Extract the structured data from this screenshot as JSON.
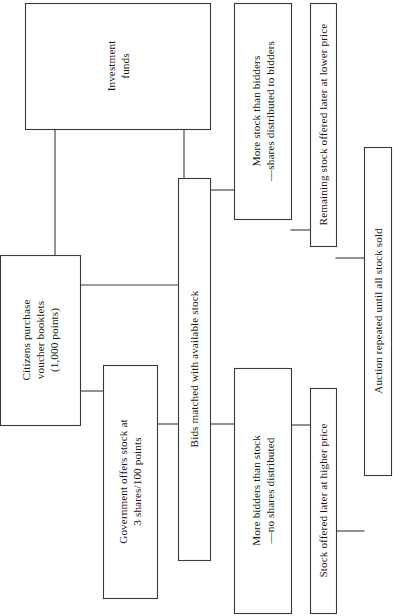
{
  "diagram": {
    "orientation": "rotated-90-ccw",
    "colors": {
      "background": "#ffffff",
      "stroke": "#3a3a3a",
      "text": "#161616"
    },
    "nodes": [
      {
        "id": "investment-funds",
        "lines": [
          "Investment",
          "funds"
        ],
        "box": {
          "x": 25,
          "y": 3,
          "w": 185,
          "h": 126
        }
      },
      {
        "id": "citizens-purchase",
        "lines": [
          "Citizens purchase",
          "voucher booklets",
          "(1,000 points)"
        ],
        "box": {
          "x": 0,
          "y": 255,
          "w": 80,
          "h": 170
        }
      },
      {
        "id": "government-offers-stock",
        "lines": [
          "Government offers stock at",
          "3 shares/100 points"
        ],
        "box": {
          "x": 103,
          "y": 365,
          "w": 54,
          "h": 233
        }
      },
      {
        "id": "bids-matched",
        "lines": [
          "Bids matched with available stock"
        ],
        "box": {
          "x": 178,
          "y": 178,
          "w": 32,
          "h": 382
        }
      },
      {
        "id": "more-stock-than-bidders",
        "lines": [
          "More stock than bidders",
          "—shares distributed to bidders"
        ],
        "box": {
          "x": 234,
          "y": 3,
          "w": 57,
          "h": 216
        }
      },
      {
        "id": "more-bidders-than-stock",
        "lines": [
          "More bidders than stock",
          "—no shares distributed"
        ],
        "box": {
          "x": 234,
          "y": 368,
          "w": 57,
          "h": 245
        }
      },
      {
        "id": "remaining-stock-lower-price",
        "lines": [
          "Remaining stock offered later at lower price"
        ],
        "box": {
          "x": 310,
          "y": 3,
          "w": 26,
          "h": 243
        }
      },
      {
        "id": "stock-offered-higher-price",
        "lines": [
          "Stock offered later at higher price"
        ],
        "box": {
          "x": 310,
          "y": 388,
          "w": 26,
          "h": 225
        }
      },
      {
        "id": "auction-repeated",
        "lines": [
          "Auction repeated until all stock sold"
        ],
        "box": {
          "x": 364,
          "y": 147,
          "w": 27,
          "h": 328
        }
      }
    ],
    "connectors": [
      {
        "id": "citizens-to-investment",
        "path": "M 55 255 L 55 129"
      },
      {
        "id": "citizens-to-bids",
        "path": "M 80 285 L 178 285"
      },
      {
        "id": "citizens-to-government",
        "path": "M 80 391 L 103 391"
      },
      {
        "id": "government-to-bids",
        "path": "M 157 424 L 178 424"
      },
      {
        "id": "investment-to-bids",
        "path": "M 184 129 L 184 178"
      },
      {
        "id": "bids-to-more-stock",
        "path": "M 210 190 L 234 190"
      },
      {
        "id": "bids-to-more-bidders",
        "path": "M 210 424 L 234 424"
      },
      {
        "id": "more-stock-to-remaining",
        "path": "M 291 230 L 310 230"
      },
      {
        "id": "more-bidders-to-stock-offered",
        "path": "M 291 425 L 310 425"
      },
      {
        "id": "remaining-to-auction",
        "path": "M 336 258 L 364 258"
      },
      {
        "id": "stock-offered-to-auction",
        "path": "M 336 531 L 364 531"
      }
    ]
  }
}
